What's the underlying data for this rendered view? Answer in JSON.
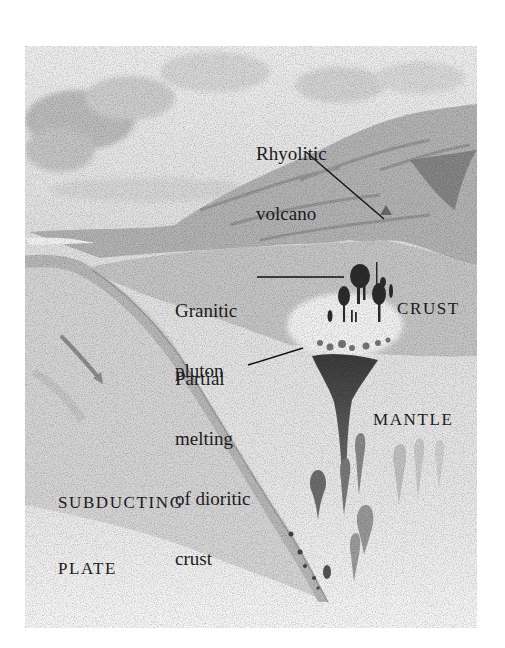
{
  "figure": {
    "labels": {
      "rhyolitic_volcano": [
        "Rhyolitic",
        "volcano"
      ],
      "granitic_pluton": [
        "Granitic",
        "pluton"
      ],
      "crust": "CRUST",
      "partial_melting": [
        "Partial",
        "melting",
        "of dioritic",
        "crust"
      ],
      "mantle": "MANTLE",
      "subducting_plate": [
        "SUBDUCTING",
        "PLATE"
      ]
    },
    "icons": {
      "subduction_arrow": "arrow-down-right-icon"
    },
    "colors": {
      "background": "#ffffff",
      "sky": "#e9e9e9",
      "clouds": "#cfcfcf",
      "mountains": "#b8b8b8",
      "crust": "#c9c9c9",
      "mantle": "#e4e4e4",
      "plate": "#dadada",
      "magma": "#3a3a3a",
      "text": "#1b1b1b"
    }
  }
}
